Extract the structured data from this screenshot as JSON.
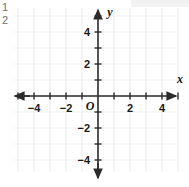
{
  "line_numbers": [
    "1",
    "2"
  ],
  "chart_data": {
    "type": "scatter",
    "title": "",
    "subtitle": "",
    "xlabel": "x",
    "ylabel": "y",
    "origin_label": "O",
    "xlim": [
      -5.3,
      5.0
    ],
    "ylim": [
      -5.5,
      5.5
    ],
    "grid": true,
    "grid_step": 1,
    "tick_step": 1,
    "x_tick_labels": [
      "-4",
      "-2",
      "2",
      "4"
    ],
    "x_tick_values": [
      -4,
      -2,
      2,
      4
    ],
    "y_tick_labels": [
      "4",
      "2",
      "-2",
      "-4"
    ],
    "y_tick_values": [
      4,
      2,
      -2,
      -4
    ],
    "legend": [],
    "series": [],
    "annotations": [],
    "axis_arrows": [
      "left",
      "right",
      "up",
      "down"
    ]
  },
  "colors": {
    "background": "#ffffff",
    "grid": "#efefef",
    "axis": "#2b2b2b",
    "tick_text": "#1a1a1a",
    "line_number": "#6e6e6e",
    "top_band": "#f2f2f2"
  }
}
